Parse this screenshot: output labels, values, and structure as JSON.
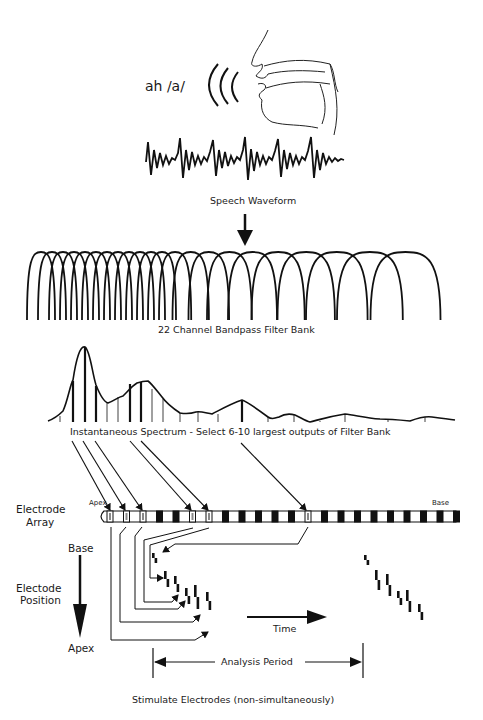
{
  "diagram": {
    "input": {
      "sound_label": "ah /a/",
      "waveform_label": "Speech Waveform"
    },
    "filter_bank": {
      "label": "22 Channel Bandpass Filter Bank",
      "channels": 22
    },
    "spectrum": {
      "label": "Instantaneous Spectrum - Select 6-10 largest outputs of Filter Bank",
      "selected_bar_color": "#111111",
      "unselected_bar_color": "#a0a0a0"
    },
    "electrode_array": {
      "label_line1": "Electrode",
      "label_line2": "Array",
      "apex_label": "Apex",
      "base_label": "Base"
    },
    "electrode_position": {
      "top_label": "Base",
      "label_line1": "Electode",
      "label_line2": "Position",
      "bottom_label": "Apex"
    },
    "time_label": "Time",
    "analysis_period_label": "Analysis Period",
    "footer_label": "Stimulate Electrodes (non-simultaneously)"
  }
}
